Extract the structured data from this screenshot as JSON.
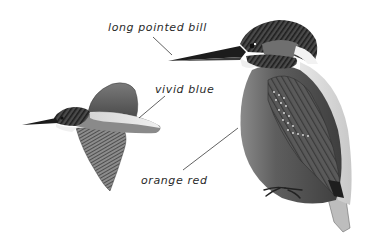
{
  "figure": {
    "style": "grayscale illustration",
    "background": "#ffffff",
    "illustrations": [
      {
        "id": "kingfisher-in-flight",
        "pose": "flying, facing left"
      },
      {
        "id": "kingfisher-perched",
        "pose": "perched, facing left"
      }
    ],
    "labels": [
      {
        "id": "bill",
        "text": "long pointed bill",
        "points_to": "bill of perched kingfisher"
      },
      {
        "id": "blue",
        "text": "vivid blue",
        "points_to": "back of flying kingfisher"
      },
      {
        "id": "orange",
        "text": "orange red",
        "points_to": "breast of perched kingfisher"
      }
    ],
    "colors": {
      "label_text": "#2a2a2a",
      "leader_line": "#3a3a3a",
      "bird_dark": "#2b2b2b",
      "bird_mid": "#6e6e6e",
      "bird_light": "#b5b5b5",
      "bird_white": "#eeeeee"
    }
  }
}
